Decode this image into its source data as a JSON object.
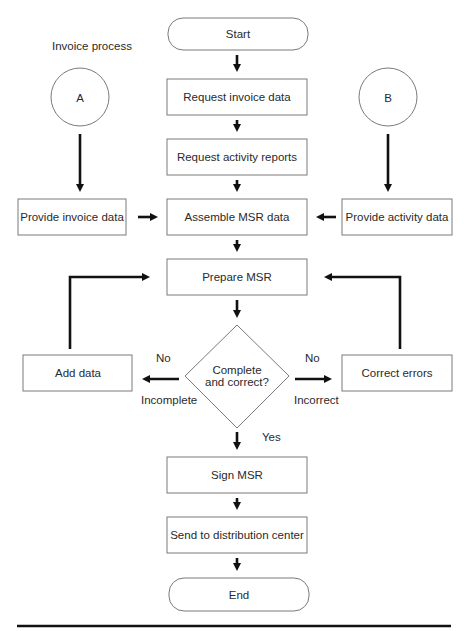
{
  "diagram": {
    "title": "Invoice process",
    "nodes": {
      "start": "Start",
      "request_invoice": "Request invoice data",
      "request_activity": "Request activity reports",
      "connector_a": "A",
      "connector_b": "B",
      "provide_invoice": "Provide invoice data",
      "assemble": "Assemble MSR data",
      "provide_activity": "Provide activity data",
      "prepare": "Prepare MSR",
      "decision_line1": "Complete",
      "decision_line2": "and correct?",
      "add_data": "Add data",
      "correct_errors": "Correct errors",
      "sign": "Sign MSR",
      "send": "Send to distribution center",
      "end": "End"
    },
    "edge_labels": {
      "left_no": "No",
      "left_reason": "Incomplete",
      "right_no": "No",
      "right_reason": "Incorrect",
      "yes": "Yes"
    },
    "colors": {
      "stroke": "#7a7a7a",
      "arrow": "#111111",
      "text": "#2a2a2a"
    }
  }
}
